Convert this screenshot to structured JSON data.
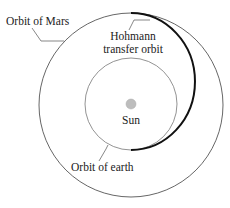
{
  "diagram": {
    "labels": {
      "mars_orbit": "Orbit of Mars",
      "transfer_line1": "Hohmann",
      "transfer_line2": "transfer orbit",
      "sun": "Sun",
      "earth_orbit": "Orbit of earth"
    },
    "colors": {
      "orbit_stroke": "#555555",
      "transfer_stroke": "#111111",
      "sun_fill": "#bdbdbd",
      "text": "#222222"
    }
  }
}
